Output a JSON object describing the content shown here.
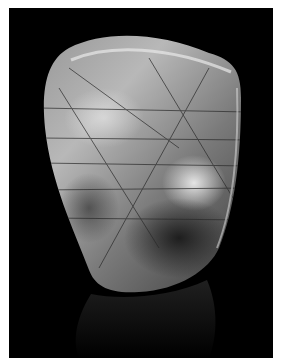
{
  "image": {
    "subject": "rutilated quartz crystal",
    "background_color": "#000000",
    "border_color": "#ffffff",
    "stone_tones": [
      "#d8d8d8",
      "#9a9a9a",
      "#5a5a5a",
      "#2a2a2a"
    ]
  }
}
